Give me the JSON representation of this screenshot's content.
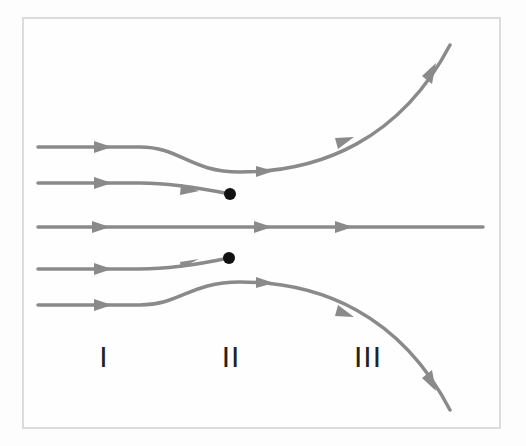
{
  "diagram": {
    "type": "flow-streamlines",
    "colors": {
      "line": "#8a8a8a",
      "dot": "#111111",
      "frame": "#dcdcdc",
      "label": "#222222"
    },
    "regions": [
      {
        "label": "I",
        "x": 104
      },
      {
        "label": "II",
        "x": 231
      },
      {
        "label": "III",
        "x": 368
      }
    ],
    "streamlines": [
      {
        "id": "top-outer",
        "description": "deflects downward then curves up to top-right"
      },
      {
        "id": "top-inner",
        "description": "terminates at upper dot"
      },
      {
        "id": "center",
        "description": "straight horizontal line"
      },
      {
        "id": "bottom-inner",
        "description": "terminates at lower dot"
      },
      {
        "id": "bottom-outer",
        "description": "deflects upward then curves down to bottom-right"
      }
    ],
    "points": [
      {
        "id": "upper-dot",
        "x": 230,
        "y": 194
      },
      {
        "id": "lower-dot",
        "x": 229,
        "y": 258
      }
    ]
  }
}
